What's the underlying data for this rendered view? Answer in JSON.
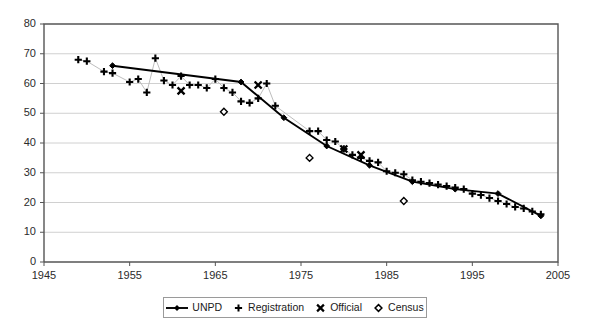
{
  "chart_data": {
    "type": "scatter",
    "title": "",
    "xlabel": "",
    "ylabel": "",
    "xlim": [
      1945,
      2005
    ],
    "ylim": [
      0,
      80
    ],
    "xticks": [
      1945,
      1955,
      1965,
      1975,
      1985,
      1995,
      2005
    ],
    "yticks": [
      0,
      10,
      20,
      30,
      40,
      50,
      60,
      70,
      80
    ],
    "grid": "horizontal",
    "legend_position": "bottom",
    "series": [
      {
        "name": "UNPD",
        "marker": "line-diamond",
        "x": [
          1953,
          1968,
          1973,
          1978,
          1983,
          1988,
          1993,
          1998,
          2003
        ],
        "values": [
          66.0,
          60.5,
          48.5,
          39.0,
          32.5,
          27.0,
          24.5,
          23.0,
          15.5
        ]
      },
      {
        "name": "Registration",
        "marker": "plus",
        "x": [
          1949,
          1950,
          1952,
          1953,
          1955,
          1956,
          1957,
          1958,
          1959,
          1960,
          1961,
          1962,
          1963,
          1964,
          1965,
          1966,
          1967,
          1968,
          1969,
          1970,
          1971,
          1972,
          1976,
          1977,
          1978,
          1979,
          1980,
          1981,
          1982,
          1983,
          1984,
          1985,
          1986,
          1987,
          1988,
          1989,
          1990,
          1991,
          1992,
          1993,
          1994,
          1995,
          1996,
          1997,
          1998,
          1999,
          2000,
          2001,
          2002,
          2003
        ],
        "values": [
          68.0,
          67.5,
          64.0,
          63.5,
          60.5,
          61.5,
          57.0,
          68.5,
          61.0,
          59.5,
          62.5,
          59.5,
          59.5,
          58.5,
          61.5,
          58.5,
          57.0,
          54.0,
          53.5,
          55.0,
          60.0,
          52.5,
          44.0,
          44.0,
          41.0,
          40.5,
          38.0,
          36.0,
          35.0,
          34.0,
          33.5,
          30.5,
          30.0,
          29.5,
          27.5,
          27.0,
          26.5,
          26.0,
          25.5,
          25.0,
          24.5,
          23.0,
          22.5,
          21.5,
          20.5,
          19.5,
          18.5,
          18.0,
          17.0,
          16.0
        ]
      },
      {
        "name": "Official",
        "marker": "cross",
        "x": [
          1961,
          1970,
          1980,
          1982
        ],
        "values": [
          57.5,
          59.5,
          38.0,
          36.0
        ]
      },
      {
        "name": "Census",
        "marker": "diamond-open",
        "x": [
          1966,
          1976,
          1987
        ],
        "values": [
          50.5,
          35.0,
          20.5
        ]
      }
    ]
  },
  "axes": {
    "y_tick_labels": [
      "80",
      "70",
      "60",
      "50",
      "40",
      "30",
      "20",
      "10",
      "0"
    ],
    "x_tick_labels": [
      "1945",
      "1955",
      "1965",
      "1975",
      "1985",
      "1995",
      "2005"
    ]
  },
  "legend": {
    "items": [
      {
        "label": "UNPD",
        "marker": "line-diamond"
      },
      {
        "label": "Registration",
        "marker": "plus"
      },
      {
        "label": "Official",
        "marker": "cross"
      },
      {
        "label": "Census",
        "marker": "diamond-open"
      }
    ]
  },
  "colors": {
    "series": "#000000",
    "axis": "#555555",
    "grid": "#d0d0d0",
    "connector": "#b5b5b5",
    "background": "#ffffff"
  }
}
